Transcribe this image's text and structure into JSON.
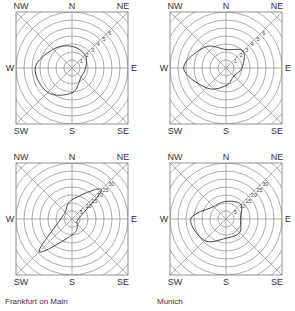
{
  "chart_data": [
    {
      "type": "radar",
      "title": "",
      "caption": "",
      "directions": [
        "N",
        "NE",
        "E",
        "SE",
        "S",
        "SW",
        "W",
        "NW"
      ],
      "ring_labels": [
        "1",
        "2",
        "3",
        "4",
        "5",
        "6"
      ],
      "values": [
        2.7,
        2.3,
        1.7,
        1.6,
        3.1,
        4.3,
        4.6,
        3.3
      ],
      "center": [
        72,
        68
      ]
    },
    {
      "type": "radar",
      "title": "",
      "caption": "",
      "directions": [
        "N",
        "NE",
        "E",
        "SE",
        "S",
        "SW",
        "W",
        "NW"
      ],
      "ring_labels": [
        "1",
        "2",
        "3",
        "4",
        "5",
        "6"
      ],
      "values": [
        2.3,
        3.0,
        2.0,
        1.4,
        2.2,
        3.5,
        5.3,
        3.7
      ],
      "center": [
        226,
        68
      ]
    },
    {
      "type": "radar",
      "title": "",
      "caption": "Frankfurt on Main",
      "directions": [
        "N",
        "NE",
        "E",
        "SE",
        "S",
        "SW",
        "W",
        "NW"
      ],
      "ring_labels": [
        "5",
        "10",
        "15",
        "20",
        "25",
        "30"
      ],
      "values": [
        12,
        26,
        4,
        5,
        10,
        29,
        7,
        6
      ],
      "center": [
        72,
        219
      ]
    },
    {
      "type": "radar",
      "title": "",
      "caption": "Munich",
      "directions": [
        "N",
        "NE",
        "E",
        "SE",
        "S",
        "SW",
        "W",
        "NW"
      ],
      "ring_labels": [
        "5",
        "10",
        "15",
        "20",
        "25",
        "30"
      ],
      "values": [
        11,
        13,
        9,
        12,
        12,
        19,
        22,
        11
      ],
      "center": [
        226,
        219
      ]
    }
  ],
  "labels": {
    "compass": [
      "N",
      "NE",
      "E",
      "SE",
      "S",
      "SW",
      "W",
      "NW"
    ],
    "caption_frankfurt": "Frankfurt on Main",
    "caption_munich": "Munich"
  }
}
